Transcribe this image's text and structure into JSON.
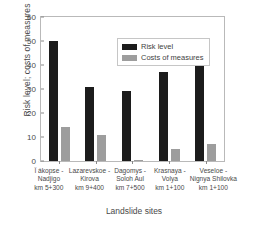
{
  "chart_data": {
    "type": "bar",
    "title": "",
    "subtitle": "",
    "xlabel": "Landslide sites",
    "ylabel": "Risk level; costs of measures",
    "ylim": [
      0,
      60
    ],
    "yticks": [
      0,
      10,
      20,
      30,
      40,
      50,
      60
    ],
    "grid": false,
    "legend_position": "upper center",
    "categories": [
      "Ï ákopse - Nadjigo km 5+300",
      "Lazarevskoe - Kirova km 9+400",
      "Dagomys - Soloh Aul km 7+500",
      "Krasnaya - Volya km 1+100",
      "Veseloe - Nignya Shilovka km 1+100"
    ],
    "category_lines": [
      [
        "Ï ákopse -",
        "Nadjigo",
        "km 5+300"
      ],
      [
        "Lazarevskoe -",
        "Kirova",
        "km 9+400"
      ],
      [
        "Dagomys -",
        "Soloh Aul",
        "km 7+500"
      ],
      [
        "Krasnaya -",
        "Volya",
        "km 1+100"
      ],
      [
        "Veseloe -",
        "Nignya Shilovka",
        "km 1+100"
      ]
    ],
    "series": [
      {
        "name": "Risk level",
        "color": "#1c1c1c",
        "values": [
          50,
          31,
          29,
          37,
          49
        ]
      },
      {
        "name": "Costs of measures",
        "color": "#9d9d9d",
        "values": [
          14,
          11,
          0.5,
          5,
          7
        ]
      }
    ]
  },
  "legend": {
    "entries": [
      {
        "label": "Risk level"
      },
      {
        "label": "Costs of measures"
      }
    ]
  }
}
